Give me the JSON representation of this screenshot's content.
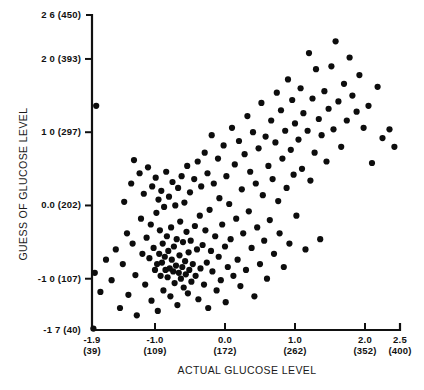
{
  "chart_data": {
    "type": "scatter",
    "title": "",
    "xlabel": "ACTUAL GLUCOSE LEVEL",
    "ylabel": "GUESS OF GLUCOSE LEVEL",
    "xlim": [
      -1.9,
      2.5
    ],
    "ylim": [
      -1.7,
      2.6
    ],
    "grid": false,
    "legend": null,
    "marker": "filled-circle",
    "xticks": [
      {
        "value": -1.9,
        "label": "-1.9",
        "label2": "(39)"
      },
      {
        "value": -1.0,
        "label": "-1.0",
        "label2": "(109)"
      },
      {
        "value": 0.0,
        "label": "0.0",
        "label2": "(172)"
      },
      {
        "value": 1.0,
        "label": "1.0",
        "label2": "(262)"
      },
      {
        "value": 2.0,
        "label": "2.0",
        "label2": "(352)"
      },
      {
        "value": 2.5,
        "label": "2.5",
        "label2": "(400)"
      }
    ],
    "yticks": [
      {
        "value": 2.6,
        "label": "2 6  (450)"
      },
      {
        "value": 2.0,
        "label": "2 0  (393)"
      },
      {
        "value": 1.0,
        "label": "1 0  (297)"
      },
      {
        "value": 0.0,
        "label": "0.0  (202)"
      },
      {
        "value": -1.0,
        "label": "-1 0  (107)"
      },
      {
        "value": -1.7,
        "label": "-1 7  (40)"
      }
    ],
    "n_points": 196,
    "points": [
      [
        -1.88,
        -1.68
      ],
      [
        -1.86,
        -0.92
      ],
      [
        -1.84,
        1.36
      ],
      [
        -1.78,
        -1.18
      ],
      [
        -1.7,
        -0.74
      ],
      [
        -1.62,
        -1.02
      ],
      [
        -1.56,
        -0.6
      ],
      [
        -1.5,
        -1.4
      ],
      [
        -1.46,
        -0.8
      ],
      [
        -1.44,
        0.05
      ],
      [
        -1.4,
        -0.38
      ],
      [
        -1.38,
        -1.22
      ],
      [
        -1.34,
        0.3
      ],
      [
        -1.32,
        -0.52
      ],
      [
        -1.3,
        0.62
      ],
      [
        -1.28,
        -0.95
      ],
      [
        -1.26,
        -1.5
      ],
      [
        -1.22,
        0.44
      ],
      [
        -1.2,
        -0.18
      ],
      [
        -1.18,
        -0.66
      ],
      [
        -1.16,
        0.16
      ],
      [
        -1.14,
        -1.08
      ],
      [
        -1.12,
        -0.44
      ],
      [
        -1.1,
        0.52
      ],
      [
        -1.08,
        -0.72
      ],
      [
        -1.06,
        -0.26
      ],
      [
        -1.05,
        -1.3
      ],
      [
        -1.04,
        0.26
      ],
      [
        -1.02,
        -0.58
      ],
      [
        -1.0,
        -0.88
      ],
      [
        -0.99,
        0.38
      ],
      [
        -0.98,
        -0.1
      ],
      [
        -0.97,
        -0.8
      ],
      [
        -0.96,
        -1.44
      ],
      [
        -0.95,
        0.08
      ],
      [
        -0.94,
        -0.66
      ],
      [
        -0.93,
        -0.34
      ],
      [
        -0.92,
        -0.96
      ],
      [
        -0.91,
        0.2
      ],
      [
        -0.9,
        -0.78
      ],
      [
        -0.89,
        -0.52
      ],
      [
        -0.88,
        -1.16
      ],
      [
        -0.87,
        -0.02
      ],
      [
        -0.86,
        -0.7
      ],
      [
        -0.85,
        -0.88
      ],
      [
        -0.84,
        0.46
      ],
      [
        -0.83,
        -0.42
      ],
      [
        -0.82,
        -0.98
      ],
      [
        -0.81,
        -0.62
      ],
      [
        -0.8,
        0.12
      ],
      [
        -0.79,
        -0.86
      ],
      [
        -0.78,
        -1.24
      ],
      [
        -0.77,
        -0.3
      ],
      [
        -0.76,
        -0.74
      ],
      [
        -0.75,
        0.32
      ],
      [
        -0.74,
        -0.9
      ],
      [
        -0.73,
        -0.56
      ],
      [
        -0.72,
        -1.06
      ],
      [
        -0.71,
        0.0
      ],
      [
        -0.7,
        -0.82
      ],
      [
        -0.69,
        -0.46
      ],
      [
        -0.68,
        -1.36
      ],
      [
        -0.67,
        0.24
      ],
      [
        -0.66,
        -0.92
      ],
      [
        -0.65,
        -0.68
      ],
      [
        -0.64,
        -0.22
      ],
      [
        -0.63,
        -1.0
      ],
      [
        -0.62,
        0.4
      ],
      [
        -0.61,
        -0.84
      ],
      [
        -0.6,
        -0.5
      ],
      [
        -0.59,
        -1.12
      ],
      [
        -0.58,
        0.04
      ],
      [
        -0.57,
        -0.76
      ],
      [
        -0.56,
        -0.94
      ],
      [
        -0.55,
        -0.36
      ],
      [
        -0.54,
        0.54
      ],
      [
        -0.53,
        -1.2
      ],
      [
        -0.52,
        -0.64
      ],
      [
        -0.51,
        -0.88
      ],
      [
        -0.5,
        0.18
      ],
      [
        -0.49,
        -0.48
      ],
      [
        -0.48,
        -1.04
      ],
      [
        -0.46,
        -0.8
      ],
      [
        -0.44,
        0.36
      ],
      [
        -0.43,
        -0.28
      ],
      [
        -0.42,
        -0.96
      ],
      [
        -0.4,
        -0.6
      ],
      [
        -0.39,
        0.6
      ],
      [
        -0.38,
        -1.28
      ],
      [
        -0.36,
        -0.14
      ],
      [
        -0.35,
        -0.86
      ],
      [
        -0.34,
        0.26
      ],
      [
        -0.32,
        -0.54
      ],
      [
        -0.3,
        -1.08
      ],
      [
        -0.29,
        0.72
      ],
      [
        -0.28,
        -0.34
      ],
      [
        -0.26,
        -0.78
      ],
      [
        -0.25,
        0.44
      ],
      [
        -0.24,
        -1.4
      ],
      [
        -0.22,
        -0.06
      ],
      [
        -0.2,
        -0.62
      ],
      [
        -0.19,
        0.96
      ],
      [
        -0.18,
        -0.9
      ],
      [
        -0.16,
        0.3
      ],
      [
        -0.14,
        -0.42
      ],
      [
        -0.12,
        -1.16
      ],
      [
        -0.1,
        0.64
      ],
      [
        -0.09,
        -0.7
      ],
      [
        -0.08,
        0.1
      ],
      [
        -0.06,
        -1.02
      ],
      [
        -0.04,
        -0.26
      ],
      [
        -0.02,
        0.82
      ],
      [
        0.0,
        -0.56
      ],
      [
        0.01,
        -1.32
      ],
      [
        0.02,
        0.4
      ],
      [
        0.04,
        -0.84
      ],
      [
        0.06,
        0.02
      ],
      [
        0.08,
        -0.46
      ],
      [
        0.1,
        1.06
      ],
      [
        0.12,
        -0.96
      ],
      [
        0.14,
        0.56
      ],
      [
        0.16,
        -0.18
      ],
      [
        0.18,
        -0.74
      ],
      [
        0.2,
        0.88
      ],
      [
        0.22,
        -1.1
      ],
      [
        0.24,
        0.22
      ],
      [
        0.26,
        -0.38
      ],
      [
        0.28,
        0.7
      ],
      [
        0.3,
        -0.88
      ],
      [
        0.32,
        1.22
      ],
      [
        0.34,
        -0.08
      ],
      [
        0.36,
        0.46
      ],
      [
        0.38,
        -0.58
      ],
      [
        0.4,
        1.0
      ],
      [
        0.42,
        -1.24
      ],
      [
        0.44,
        0.3
      ],
      [
        0.46,
        -0.3
      ],
      [
        0.48,
        0.78
      ],
      [
        0.5,
        -0.8
      ],
      [
        0.52,
        1.4
      ],
      [
        0.54,
        0.14
      ],
      [
        0.56,
        -0.48
      ],
      [
        0.58,
        0.94
      ],
      [
        0.6,
        -1.0
      ],
      [
        0.62,
        0.54
      ],
      [
        0.64,
        -0.2
      ],
      [
        0.66,
        1.16
      ],
      [
        0.68,
        0.36
      ],
      [
        0.7,
        -0.66
      ],
      [
        0.72,
        0.86
      ],
      [
        0.74,
        1.54
      ],
      [
        0.76,
        0.06
      ],
      [
        0.78,
        -0.38
      ],
      [
        0.8,
        1.3
      ],
      [
        0.82,
        0.64
      ],
      [
        0.84,
        -0.84
      ],
      [
        0.86,
        1.02
      ],
      [
        0.88,
        0.24
      ],
      [
        0.9,
        1.72
      ],
      [
        0.92,
        -0.52
      ],
      [
        0.94,
        0.76
      ],
      [
        0.96,
        1.44
      ],
      [
        0.98,
        0.42
      ],
      [
        1.0,
        1.12
      ],
      [
        1.02,
        -0.14
      ],
      [
        1.05,
        0.9
      ],
      [
        1.08,
        1.6
      ],
      [
        1.1,
        0.5
      ],
      [
        1.12,
        1.26
      ],
      [
        1.15,
        -0.6
      ],
      [
        1.18,
        1.02
      ],
      [
        1.2,
        2.08
      ],
      [
        1.22,
        0.34
      ],
      [
        1.25,
        1.46
      ],
      [
        1.28,
        0.72
      ],
      [
        1.3,
        1.86
      ],
      [
        1.34,
        1.18
      ],
      [
        1.36,
        -0.46
      ],
      [
        1.38,
        0.96
      ],
      [
        1.42,
        1.56
      ],
      [
        1.45,
        0.6
      ],
      [
        1.48,
        1.32
      ],
      [
        1.52,
        1.9
      ],
      [
        1.55,
        1.04
      ],
      [
        1.58,
        2.24
      ],
      [
        1.62,
        1.42
      ],
      [
        1.66,
        0.8
      ],
      [
        1.7,
        1.66
      ],
      [
        1.74,
        1.16
      ],
      [
        1.78,
        2.02
      ],
      [
        1.82,
        1.5
      ],
      [
        1.88,
        1.28
      ],
      [
        1.92,
        1.78
      ],
      [
        1.98,
        1.06
      ],
      [
        2.05,
        1.36
      ],
      [
        2.1,
        0.58
      ],
      [
        2.18,
        1.62
      ],
      [
        2.25,
        0.92
      ],
      [
        2.35,
        1.04
      ],
      [
        2.42,
        0.8
      ]
    ]
  }
}
